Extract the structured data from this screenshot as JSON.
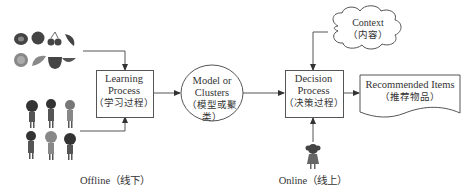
{
  "nodes": {
    "learning": {
      "line1": "Learning",
      "line2": "Process",
      "line3": "（学习过程）"
    },
    "model": {
      "line1": "Model or",
      "line2": "Clusters",
      "line3": "（模型或聚类）"
    },
    "decision": {
      "line1": "Decision",
      "line2": "Process",
      "line3": "（决策过程）"
    },
    "context": {
      "line1": "Context",
      "line2": "（内容）"
    },
    "recommended": {
      "line1": "Recommended Items",
      "line2": "（推荐物品）"
    }
  },
  "labels": {
    "offline": "Offline（线下）",
    "online": "Online（线上）"
  },
  "icons": {
    "items": "fruit-items-icon",
    "users": "user-group-icon",
    "online_user": "single-user-icon"
  },
  "colors": {
    "line": "#555555",
    "text": "#333333",
    "figure": "#444444"
  }
}
